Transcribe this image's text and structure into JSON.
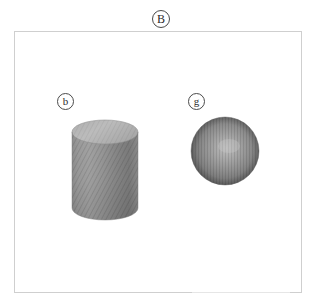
{
  "figure": {
    "panel_label": "B",
    "background_color": "#ffffff",
    "frame_color": "#cfcfcf",
    "label_color": "#2b2b2b"
  },
  "objects": [
    {
      "id": "cylinder",
      "label": "b",
      "shape_name": "cylinder",
      "surface": "diagonal-hatched",
      "base_color": "#909090",
      "top_color": "#b4b4b4",
      "shadow_color": "#6d6d6d"
    },
    {
      "id": "sphere",
      "label": "g",
      "shape_name": "sphere",
      "surface": "vertical-hatched",
      "base_color": "#7e7e7e",
      "highlight_color": "#b8b8b8",
      "shadow_color": "#4f4f4f"
    }
  ],
  "annotations": {
    "bottom_rule_color": "#e6e6e6"
  }
}
